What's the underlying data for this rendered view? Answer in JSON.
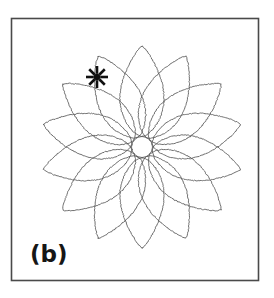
{
  "figure": {
    "panel_label": "(b)",
    "frame": {
      "x": 11.5,
      "y": 18.5,
      "width": 247,
      "height": 262,
      "stroke": "#4a4a4a",
      "stroke_width": 1.6,
      "fill": "#ffffff"
    },
    "background_color": "#ffffff",
    "label_position": {
      "x": 30,
      "y": 262
    }
  },
  "chart_data": {
    "type": "line",
    "title": "",
    "subtitle": "",
    "xlabel": "",
    "ylabel": "",
    "grid": false,
    "legend": null,
    "annotations": [
      {
        "name": "starburst-marker",
        "glyph": "starburst",
        "x": 97,
        "y": 77,
        "rays": 8,
        "color": "#101010",
        "outer_radius": 11,
        "inner_radius": 3.2,
        "ray_width": 2.6
      }
    ],
    "curve": {
      "name": "rosette-trajectory",
      "description": "spirograph rose / hypotrochoid petal trajectory",
      "petal_count": 14,
      "center": {
        "x": 142,
        "y": 147
      },
      "outer_radius": 101,
      "inner_hole_radius": 10.5,
      "petal_half_width": 22,
      "rotation_offset_deg": -90,
      "stroke": "#555555",
      "stroke_width": 0.85,
      "fill": "none",
      "jitter": 0.9,
      "xlim": [
        38,
        243
      ],
      "ylim": [
        45,
        248
      ]
    }
  }
}
